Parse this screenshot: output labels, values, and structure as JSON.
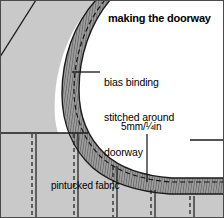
{
  "diagram": {
    "title": "making the doorway",
    "labels": {
      "bias_line1": "bias binding",
      "bias_line2": "stitched around",
      "bias_line3": "doorway",
      "measurement": "5mm/¼in",
      "pintucked_fabric": "pintucked fabric"
    },
    "colors": {
      "fabric": "#c9c9c9",
      "fabric_shadow": "#bdbdbd",
      "binding": "#9a9a9a",
      "binding_hatch": "#6f6f6f",
      "opening": "#ffffff",
      "ink": "#1a1a1a",
      "frame": "#4a4a4a",
      "text": "#000000"
    },
    "elements": {
      "fabric_panel": "pintucked fabric panel",
      "bias_binding_band": "curved bias binding strip",
      "doorway_opening": "white doorway opening",
      "stitch_line": "dashed stitching line on binding",
      "fold_line": "diagonal fold line upper left",
      "hem_line": "horizontal hem line",
      "pintucks": "vertical pintuck stitch pairs",
      "bias_leader": "leader line to bias binding",
      "measure_leader": "leader line to 5mm binding width"
    }
  }
}
